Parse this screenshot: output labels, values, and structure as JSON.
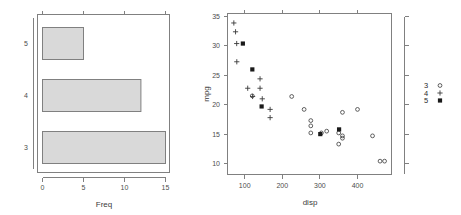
{
  "figure": {
    "title": "",
    "panels": 2,
    "background": "#ffffff",
    "colors": {
      "bar_fill": "#d9d9d9",
      "bar_border": "#808080",
      "axis": "#808080",
      "text": "#3a3a3a",
      "point": "#3a3a3a"
    }
  },
  "chart_data": [
    {
      "type": "bar",
      "orientation": "horizontal",
      "title": "",
      "xlabel": "Freq",
      "ylabel": "",
      "categories": [
        "3",
        "4",
        "5"
      ],
      "values": [
        15,
        12,
        5
      ],
      "xlim": [
        0,
        16.5
      ],
      "xticks": [
        0,
        5,
        10,
        15
      ],
      "xtick_labels": [
        "0",
        "5",
        "10",
        "15"
      ],
      "ytick_labels": [
        "5",
        "4",
        "3"
      ],
      "grid": false,
      "legend": "none",
      "box": true
    },
    {
      "type": "scatter",
      "title": "",
      "xlabel": "disp",
      "ylabel": "mpg",
      "xlim": [
        54,
        490
      ],
      "ylim": [
        9.2,
        35.3
      ],
      "xticks": [
        100,
        200,
        300,
        400
      ],
      "xtick_labels": [
        "100",
        "200",
        "300",
        "400"
      ],
      "yticks": [
        10,
        15,
        20,
        25,
        30,
        35
      ],
      "ytick_labels": [
        "10",
        "15",
        "20",
        "25",
        "30",
        "35"
      ],
      "grid": false,
      "box": true,
      "right_axis_ticks": true,
      "legend": {
        "position": "right",
        "entries": [
          {
            "label": "3",
            "marker": "open-circle"
          },
          {
            "label": "4",
            "marker": "plus"
          },
          {
            "label": "5",
            "marker": "filled-square"
          }
        ]
      },
      "series": [
        {
          "name": "3",
          "marker": "open-circle",
          "points": [
            {
              "x": 225,
              "y": 21.4
            },
            {
              "x": 258,
              "y": 19.2
            },
            {
              "x": 360,
              "y": 14.3
            },
            {
              "x": 360,
              "y": 14.7
            },
            {
              "x": 275.8,
              "y": 17.3
            },
            {
              "x": 275.8,
              "y": 16.4
            },
            {
              "x": 275.8,
              "y": 15.2
            },
            {
              "x": 472,
              "y": 10.4
            },
            {
              "x": 460,
              "y": 10.4
            },
            {
              "x": 440,
              "y": 14.7
            },
            {
              "x": 318,
              "y": 15.5
            },
            {
              "x": 304,
              "y": 15.2
            },
            {
              "x": 350,
              "y": 15.2
            },
            {
              "x": 400,
              "y": 19.2
            },
            {
              "x": 350,
              "y": 13.3
            },
            {
              "x": 120.1,
              "y": 21.5
            },
            {
              "x": 360,
              "y": 18.7
            }
          ]
        },
        {
          "name": "4",
          "marker": "plus",
          "points": [
            {
              "x": 71.1,
              "y": 33.9
            },
            {
              "x": 75.7,
              "y": 32.4
            },
            {
              "x": 78.7,
              "y": 30.4
            },
            {
              "x": 79.0,
              "y": 27.3
            },
            {
              "x": 108,
              "y": 22.8
            },
            {
              "x": 140.8,
              "y": 24.4
            },
            {
              "x": 140.8,
              "y": 22.8
            },
            {
              "x": 146.7,
              "y": 21.0
            },
            {
              "x": 167.6,
              "y": 19.2
            },
            {
              "x": 167.6,
              "y": 17.8
            },
            {
              "x": 121,
              "y": 21.4
            }
          ]
        },
        {
          "name": "5",
          "marker": "filled-square",
          "points": [
            {
              "x": 95.1,
              "y": 30.4
            },
            {
              "x": 120.3,
              "y": 26.0
            },
            {
              "x": 145,
              "y": 19.7
            },
            {
              "x": 301,
              "y": 15.0
            },
            {
              "x": 351,
              "y": 15.8
            }
          ]
        }
      ]
    }
  ],
  "left_panel": {
    "xlabel": "Freq",
    "xtick_labels": [
      "0",
      "5",
      "10",
      "15"
    ],
    "ytick_labels": [
      "5",
      "4",
      "3"
    ]
  },
  "right_panel": {
    "xlabel": "disp",
    "ylabel": "mpg",
    "xtick_labels": [
      "100",
      "200",
      "300",
      "400"
    ],
    "ytick_labels": [
      "10",
      "15",
      "20",
      "25",
      "30",
      "35"
    ],
    "legend_labels": [
      "3",
      "4",
      "5"
    ]
  }
}
